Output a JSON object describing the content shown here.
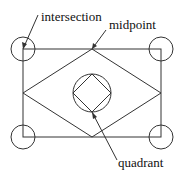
{
  "diagram": {
    "labels": {
      "intersection": "intersection",
      "midpoint": "midpoint",
      "quadrant": "quadrant"
    },
    "colors": {
      "stroke": "#333333",
      "text": "#111111",
      "background": "#ffffff"
    },
    "rectangle": {
      "x1": 23,
      "y1": 49,
      "x2": 161,
      "y2": 137
    },
    "corner_circle_radius": 12,
    "center_circle": {
      "cx": 92,
      "cy": 93,
      "r": 19
    }
  }
}
